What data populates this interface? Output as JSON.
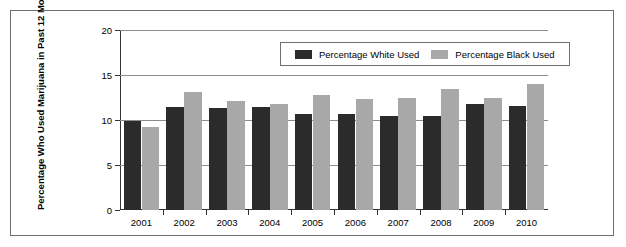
{
  "figure": {
    "background_color": "#ffffff",
    "frame_color": "#6e6e6e"
  },
  "chart_data": {
    "type": "bar",
    "title": "",
    "xlabel": "",
    "ylabel": "Percentage Who Used Marijuana in Past 12 Months",
    "categories": [
      "2001",
      "2002",
      "2003",
      "2004",
      "2005",
      "2006",
      "2007",
      "2008",
      "2009",
      "2010"
    ],
    "series": [
      {
        "name": "Percentage White Used",
        "color": "#2b2b2b",
        "values": [
          9.9,
          11.4,
          11.3,
          11.4,
          10.7,
          10.7,
          10.5,
          10.4,
          11.8,
          11.6
        ]
      },
      {
        "name": "Percentage Black Used",
        "color": "#a8a8a8",
        "values": [
          9.2,
          13.1,
          12.1,
          11.8,
          12.8,
          12.3,
          12.4,
          13.4,
          12.4,
          14.0
        ]
      }
    ],
    "ylim": [
      0,
      20
    ],
    "yticks": [
      0,
      5,
      10,
      15,
      20
    ],
    "ytick_labels": [
      "0",
      "5",
      "10",
      "15",
      "20"
    ],
    "grid": true,
    "grid_axis": "y",
    "legend_position": "upper right (inside plot)"
  }
}
